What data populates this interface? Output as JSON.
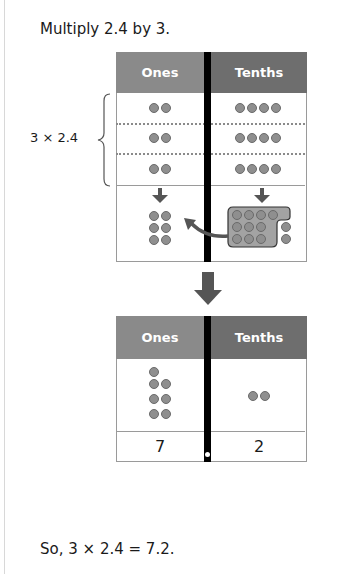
{
  "prompt": "Multiply 2.4 by 3.",
  "brace_label": "3 × 2.4",
  "table_top": {
    "headers": {
      "ones": "Ones",
      "tenths": "Tenths"
    },
    "rows": [
      {
        "ones_counters": 2,
        "tenths_counters": 4
      },
      {
        "ones_counters": 2,
        "tenths_counters": 4
      },
      {
        "ones_counters": 2,
        "tenths_counters": 4
      }
    ],
    "combined": {
      "ones_counters": 6,
      "tenths_counters": 12,
      "tenths_grouped": 10,
      "regroup_note": "10 tenths regrouped as 1 one"
    }
  },
  "table_bottom": {
    "headers": {
      "ones": "Ones",
      "tenths": "Tenths"
    },
    "ones_counters": 7,
    "tenths_counters": 2,
    "digits": {
      "ones": "7",
      "tenths": "2"
    }
  },
  "conclusion": "So, 3 × 2.4 = 7.2.",
  "colors": {
    "ones_header": "#8a8a8a",
    "tenths_header": "#6e6e6e",
    "counter": "#8f8f8f",
    "divider": "#000000",
    "arrow": "#555555"
  }
}
